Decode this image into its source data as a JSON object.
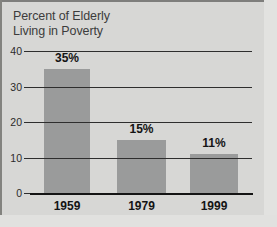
{
  "chart_data": {
    "type": "bar",
    "title": "Percent of Elderly\nLiving in Poverty",
    "xlabel": "",
    "ylabel": "",
    "categories": [
      "1959",
      "1979",
      "1999"
    ],
    "values": [
      35,
      15,
      11
    ],
    "data_labels": [
      "35%",
      "15%",
      "11%"
    ],
    "ylim": [
      0,
      40
    ],
    "yticks": [
      0,
      10,
      20,
      30,
      40
    ],
    "ytick_labels": [
      "0",
      "10",
      "20",
      "30",
      "40"
    ],
    "grid": "horizontal-gridlines-over-bars",
    "legend": "none",
    "series": [
      {
        "name": "Percent of Elderly Living in Poverty",
        "values": [
          35,
          15,
          11
        ]
      }
    ]
  },
  "style": {
    "background_color": "#d7d7d5",
    "bar_color": "#9a9b9b",
    "gridline_color": "#2e2e2e",
    "axis_color": "#141414",
    "title_color": "#3c3c3c",
    "label_color": "#141414"
  }
}
